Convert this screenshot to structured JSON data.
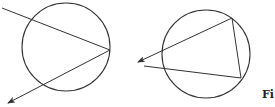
{
  "figure": {
    "caption_visible": "Fi",
    "stroke_color": "#333333",
    "background": "#ffffff"
  },
  "diagrams": [
    {
      "name": "left-circle-diagram",
      "circle": {
        "cx": 66,
        "cy": 47,
        "r": 44
      },
      "lines": [
        {
          "from": [
            2,
            8
          ],
          "to": [
            110,
            50
          ],
          "arrow": false
        },
        {
          "from": [
            110,
            50
          ],
          "to": [
            8,
            103
          ],
          "arrow": true
        }
      ]
    },
    {
      "name": "right-circle-diagram",
      "circle": {
        "cx": 206,
        "cy": 54,
        "r": 44
      },
      "lines": [
        {
          "from": [
            232,
            18
          ],
          "to": [
            138,
            62
          ],
          "arrow": true
        },
        {
          "from": [
            232,
            18
          ],
          "to": [
            241,
            78
          ],
          "arrow": false
        },
        {
          "from": [
            144,
            66
          ],
          "to": [
            241,
            78
          ],
          "arrow": false
        }
      ]
    }
  ]
}
